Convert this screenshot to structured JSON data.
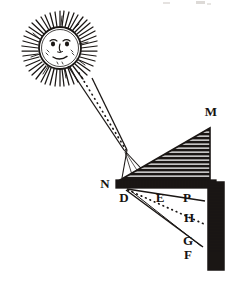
{
  "figure": {
    "medium": "woodcut engraving",
    "background_color": "#ffffff",
    "ink_color": "#1a1614",
    "width": 236,
    "height": 281
  },
  "header": {
    "partial_text": "",
    "note": "faint cut-off marks along top edge, illegible",
    "color": "#cfcbc6"
  },
  "sun": {
    "name": "sun",
    "center_x": 60,
    "center_y": 48,
    "disc_radius": 21,
    "ray_outer_radius": 35,
    "ray_count": 52,
    "has_face": true,
    "face": {
      "eyes": 2,
      "nose": 1,
      "mouth": 1,
      "cheeks": 2
    }
  },
  "beam": {
    "name": "incident-light-beam",
    "from": "sun",
    "to": "prism-entry-point",
    "origin_x": 74,
    "origin_y": 72,
    "converge_x": 125,
    "converge_y": 150,
    "has_center_dotted_axis": true
  },
  "prism": {
    "name": "triangular-prism",
    "apex_x": 210,
    "apex_y": 128,
    "left_x": 120,
    "left_y": 180,
    "right_x": 210,
    "right_y": 180,
    "hatching": "horizontal-lines",
    "hatch_spacing": 4
  },
  "base_bar": {
    "name": "base-support-bar",
    "x": 116,
    "y": 180,
    "width": 100,
    "height": 8,
    "hatching": "vertical-ticks"
  },
  "screen_bar": {
    "name": "vertical-screen-bar",
    "x": 208,
    "y": 182,
    "width": 16,
    "height": 88,
    "hatching": "horizontal-lines"
  },
  "refracted_beam": {
    "name": "refracted-light-beam",
    "entry_x": 126,
    "entry_y": 188,
    "upper_end_x": 205,
    "upper_end_y": 200,
    "lower_end_x": 202,
    "lower_end_y": 248,
    "center_dotted_end_x": 204,
    "center_dotted_end_y": 224,
    "spread": "fan"
  },
  "labels": [
    {
      "id": "label-M",
      "text": "M",
      "x": 211,
      "y": 116,
      "role": "prism-apex"
    },
    {
      "id": "label-N",
      "text": "N",
      "x": 105,
      "y": 188,
      "role": "base-left-end"
    },
    {
      "id": "label-D",
      "text": "D",
      "x": 124,
      "y": 202,
      "role": "prism-entry-point"
    },
    {
      "id": "label-E",
      "text": "E",
      "x": 160,
      "y": 202,
      "role": "base-midpoint"
    },
    {
      "id": "label-P",
      "text": "P",
      "x": 187,
      "y": 202,
      "role": "screen-top"
    },
    {
      "id": "label-H",
      "text": "H",
      "x": 189,
      "y": 222,
      "role": "screen-middle"
    },
    {
      "id": "label-G",
      "text": "G",
      "x": 188,
      "y": 245,
      "role": "screen-lower"
    },
    {
      "id": "label-F",
      "text": "F",
      "x": 188,
      "y": 259,
      "role": "screen-bottom"
    }
  ]
}
